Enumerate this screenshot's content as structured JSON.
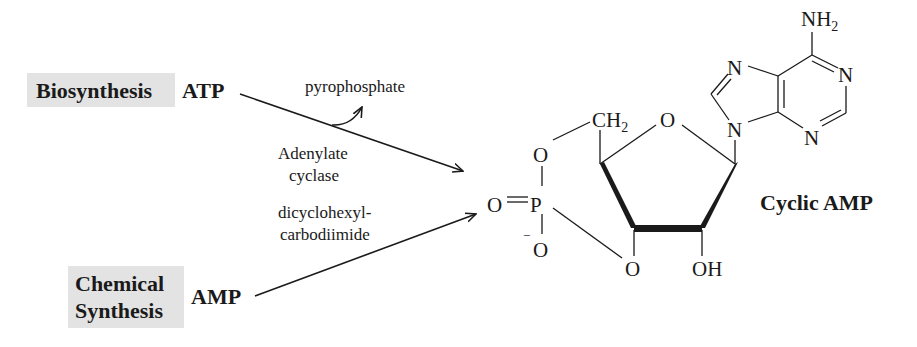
{
  "diagram": {
    "sources": [
      {
        "label": "Biosynthesis",
        "substrate": "ATP"
      },
      {
        "label_line1": "Chemical",
        "label_line2": "Synthesis",
        "substrate": "AMP"
      }
    ],
    "reagents": {
      "byproduct": "pyrophosphate",
      "enzyme_line1": "Adenylate",
      "enzyme_line2": "cyclase",
      "chemical_line1": "dicyclohexyl-",
      "chemical_line2": "carbodiimide"
    },
    "product": {
      "name": "Cyclic AMP",
      "atoms": {
        "nh2": "NH",
        "nh2_sub": "2",
        "n": "N",
        "o": "O",
        "ch2": "CH",
        "ch2_sub": "2",
        "p": "P",
        "o_minus": "O",
        "minus": "−",
        "oh": "OH"
      }
    },
    "colors": {
      "highlight_box": "#e3e3e3",
      "ink": "#1a1a1a"
    }
  }
}
